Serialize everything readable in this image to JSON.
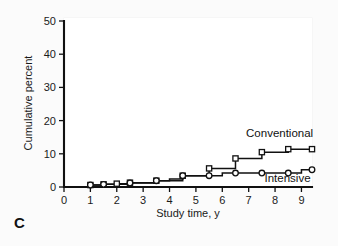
{
  "panel": {
    "label": "C"
  },
  "chart_data": {
    "type": "line",
    "subtype": "step",
    "title": "",
    "xlabel": "Study time, y",
    "ylabel": "Cumulative percent",
    "xlim": [
      0,
      9.4
    ],
    "ylim": [
      0,
      50
    ],
    "xticks": [
      0,
      1,
      2,
      3,
      4,
      5,
      6,
      7,
      8,
      9
    ],
    "xticklabels": [
      "0",
      "1",
      "2",
      "3",
      "4",
      "5",
      "6",
      "7",
      "8",
      "9"
    ],
    "yticks": [
      0,
      10,
      20,
      30,
      40,
      50
    ],
    "yticklabels": [
      "0",
      "10",
      "20",
      "30",
      "40",
      "50"
    ],
    "grid": false,
    "legend_position": "inline-right",
    "series": [
      {
        "name": "Conventional",
        "marker": "square",
        "label_text": "Conventional",
        "x": [
          0,
          1,
          1.5,
          2,
          2.5,
          3,
          3.5,
          4,
          4.5,
          5,
          5.5,
          6,
          6.5,
          7,
          7.5,
          8,
          8.5,
          9,
          9.4
        ],
        "values": [
          0,
          0.6,
          0.8,
          1.0,
          1.3,
          1.3,
          1.9,
          2.4,
          3.4,
          3.4,
          5.6,
          5.6,
          8.6,
          8.6,
          10.5,
          10.5,
          11.4,
          11.4,
          11.4
        ],
        "marker_x": [
          1,
          1.5,
          2,
          2.5,
          3.5,
          4.5,
          5.5,
          6.5,
          7.5,
          8.5,
          9.4
        ],
        "marker_y": [
          0.6,
          0.8,
          1.0,
          1.3,
          1.9,
          3.4,
          5.6,
          8.6,
          10.5,
          11.4,
          11.4
        ]
      },
      {
        "name": "Intensive",
        "marker": "circle",
        "label_text": "Intensive",
        "x": [
          0,
          1,
          1.5,
          2,
          2.5,
          3,
          3.5,
          4,
          4.5,
          5,
          5.5,
          6,
          6.5,
          7,
          7.5,
          8,
          8.5,
          9,
          9.4
        ],
        "values": [
          0,
          0.6,
          0.8,
          0.8,
          1.2,
          1.2,
          1.9,
          1.9,
          3.4,
          3.4,
          3.4,
          4.2,
          4.2,
          4.2,
          4.2,
          4.2,
          4.2,
          5.2,
          5.2
        ],
        "marker_x": [
          1,
          1.5,
          2.5,
          3.5,
          4.5,
          5.5,
          6.5,
          7.5,
          8.5,
          9.4
        ],
        "marker_y": [
          0.6,
          0.8,
          1.2,
          1.9,
          3.4,
          3.4,
          4.2,
          4.2,
          4.2,
          5.2
        ]
      }
    ],
    "annotations": [
      {
        "text": "Conventional",
        "x": 6.9,
        "y": 15.0
      },
      {
        "text": "Intensive",
        "x": 7.6,
        "y": 1.6
      }
    ]
  }
}
